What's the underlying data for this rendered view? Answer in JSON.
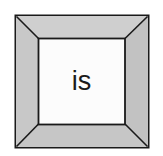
{
  "figure": {
    "type": "beveled-square-frame",
    "label": "is",
    "background_color": "#ffffff",
    "frame": {
      "bevel_color": "#c9c9c9",
      "bevel_color_top": "#cfcfcf",
      "bevel_color_left": "#c8c8c8",
      "bevel_color_right": "#c4c4c4",
      "bevel_color_bottom": "#c6c6c6",
      "outline_color": "#1a1a1a",
      "outline_width": 2,
      "miter_line_color": "#1a1a1a",
      "interior_color": "#fcfcfc",
      "outer_bounds": {
        "x": 15,
        "y": 15,
        "width": 134,
        "height": 133
      },
      "inner_bounds": {
        "x": 38,
        "y": 38,
        "width": 87,
        "height": 87
      }
    },
    "text": {
      "content": "is",
      "color": "#1a1a1a",
      "font_size_px": 27,
      "align": "center"
    }
  }
}
